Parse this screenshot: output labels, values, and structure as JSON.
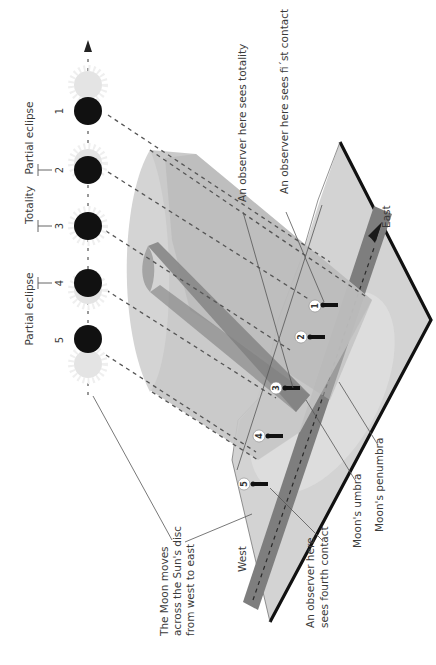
{
  "diagram": {
    "orientation": "rotated 90 degrees counter-clockwise",
    "colors": {
      "moon": "#111111",
      "sun": "#e6e6e6",
      "sun_rays": "#ececec",
      "penumbra_cone": "#c8c8c8",
      "penumbra_cone_dark": "#b4b4b4",
      "umbra_cylinder": "#8c8c8c",
      "ground": "#d2d2d2",
      "ground_edge": "#111111",
      "track": "#7d7d7d",
      "penumbra_on_ground": "#dedede"
    },
    "phase_labels": [
      {
        "id": "partial-1",
        "text": "Partial eclipse"
      },
      {
        "id": "totality",
        "text": "Totality"
      },
      {
        "id": "partial-2",
        "text": "Partial eclipse"
      }
    ],
    "stages": [
      {
        "number": "1"
      },
      {
        "number": "2"
      },
      {
        "number": "3"
      },
      {
        "number": "4"
      },
      {
        "number": "5"
      }
    ],
    "observers": [
      {
        "badge": "1"
      },
      {
        "badge": "2"
      },
      {
        "badge": "3"
      },
      {
        "badge": "4"
      },
      {
        "badge": "5"
      }
    ],
    "callouts": {
      "totality": "An observer here sees totality",
      "first_contact": "An observer here sees fi´st contact",
      "fourth_contact_line1": "An observer here",
      "fourth_contact_line2": "sees fourth contact",
      "umbra": "Moon's umbra",
      "penumbra": "Moon's penumbra",
      "moon_moves_line1": "The Moon moves",
      "moon_moves_line2": "across the Sun's disc",
      "moon_moves_line3": "from west to east"
    },
    "directions": {
      "east": "East",
      "west": "West"
    }
  }
}
